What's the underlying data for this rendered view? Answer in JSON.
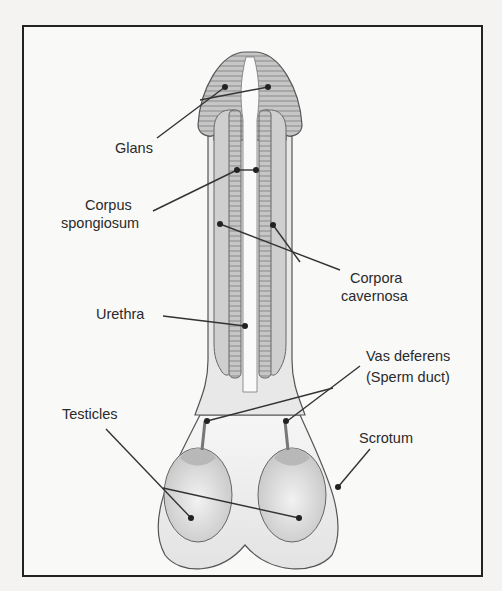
{
  "diagram": {
    "title": "",
    "type": "anatomical-labeled-diagram",
    "labels": {
      "glans": "Glans",
      "corpus_spongiosum_1": "Corpus",
      "corpus_spongiosum_2": "spongiosum",
      "corpora_cavernosa_1": "Corpora",
      "corpora_cavernosa_2": "cavernosa",
      "urethra": "Urethra",
      "vas_deferens_1": "Vas deferens",
      "vas_deferens_2": "(Sperm duct)",
      "testicles": "Testicles",
      "scrotum": "Scrotum"
    },
    "colors": {
      "border": "#222222",
      "tissue_fill": "#c9c9c9",
      "tissue_stripe": "#a9a9a9",
      "outline": "#555555",
      "leader_line": "#333333",
      "background": "#f9f9f8"
    }
  }
}
